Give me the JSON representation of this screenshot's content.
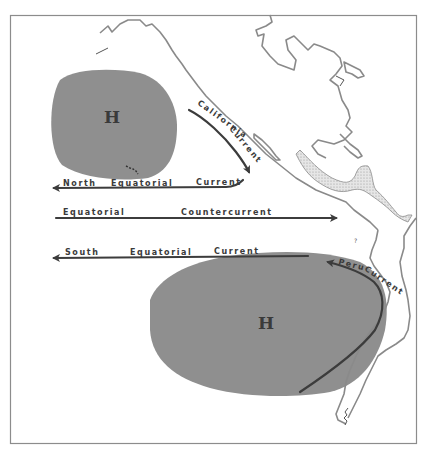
{
  "diagram": {
    "title": "",
    "colors": {
      "background": "#ffffff",
      "frame": "#8c8c8c",
      "high_pressure": "#8f8f8f",
      "current_line": "#3c3c3c",
      "label": "#3a3a3a",
      "coastline": "#8a8a8a",
      "land_stipple": "#cfcfcf"
    },
    "pressure_systems": [
      {
        "id": "north-pacific-high",
        "label": "H"
      },
      {
        "id": "south-pacific-high",
        "label": "H"
      }
    ],
    "currents": [
      {
        "id": "california-current",
        "words": [
          "California",
          "Current"
        ],
        "direction": "south-southeast"
      },
      {
        "id": "north-equatorial-current",
        "words": [
          "North",
          "Equatorial",
          "Current"
        ],
        "direction": "west"
      },
      {
        "id": "equatorial-countercurrent",
        "words": [
          "Equatorial",
          "Countercurrent"
        ],
        "direction": "east"
      },
      {
        "id": "south-equatorial-current",
        "words": [
          "South",
          "Equatorial",
          "Current"
        ],
        "direction": "west"
      },
      {
        "id": "peru-current",
        "words": [
          "Peru",
          "Current"
        ],
        "direction": "north-northwest"
      }
    ],
    "minor_marks": {
      "island_mark": "?"
    }
  }
}
